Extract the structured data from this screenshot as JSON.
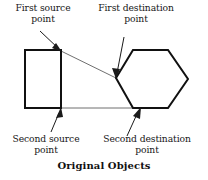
{
  "figure": {
    "caption": "Original Objects",
    "labels": {
      "first_source": "First source\npoint",
      "first_destination": "First destination\npoint",
      "second_source": "Second source\npoint",
      "second_destination": "Second destination\npoint"
    },
    "colors": {
      "shape_stroke": "#111111",
      "connector_stroke": "#3a3a3a",
      "arrow_stroke": "#1a1a1a",
      "background": "#ffffff",
      "text": "#161616"
    },
    "shapes": [
      {
        "name": "source-rectangle",
        "type": "rectangle",
        "x": 25,
        "y": 50,
        "width": 36,
        "height": 58
      },
      {
        "name": "destination-hexagon",
        "type": "hexagon",
        "points": "133,50 168,50 188,79 168,108 133,108 116,78"
      }
    ],
    "connectors": [
      {
        "name": "top-connector-line",
        "from": [
          61,
          51
        ],
        "to": [
          116,
          78
        ]
      },
      {
        "name": "bottom-connector-line",
        "from": [
          61,
          108
        ],
        "to": [
          148,
          108
        ]
      }
    ],
    "annotations": [
      {
        "name": "first-source-arrow",
        "from": [
          40,
          31
        ],
        "to": [
          61,
          51
        ]
      },
      {
        "name": "first-destination-arrow",
        "from": [
          124,
          37
        ],
        "to": [
          116,
          77
        ]
      },
      {
        "name": "second-source-arrow",
        "from": [
          51,
          132
        ],
        "to": [
          61,
          109
        ]
      },
      {
        "name": "second-destination-arrow",
        "from": [
          127,
          136
        ],
        "to": [
          140,
          109
        ]
      }
    ]
  }
}
